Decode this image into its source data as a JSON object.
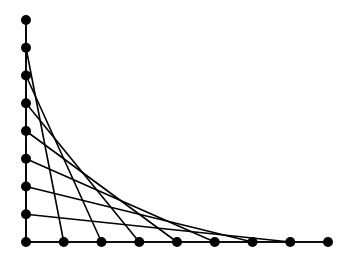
{
  "diagram": {
    "type": "string-art-envelope",
    "color": "#000000",
    "background": "#ffffff",
    "origin": [
      26,
      242
    ],
    "axis_points": {
      "vertical": [
        [
          26,
          20
        ],
        [
          26,
          47.75
        ],
        [
          26,
          75.5
        ],
        [
          26,
          103.25
        ],
        [
          26,
          131
        ],
        [
          26,
          158.75
        ],
        [
          26,
          186.5
        ],
        [
          26,
          214.25
        ],
        [
          26,
          242
        ]
      ],
      "horizontal": [
        [
          26,
          242
        ],
        [
          63.75,
          242
        ],
        [
          101.5,
          242
        ],
        [
          139.25,
          242
        ],
        [
          177,
          242
        ],
        [
          214.75,
          242
        ],
        [
          252.5,
          242
        ],
        [
          290.25,
          242
        ],
        [
          328,
          242
        ]
      ]
    },
    "point_radius": 5,
    "lines_description": "Vertical point i (from top) connects to horizontal point i (from origin)"
  }
}
